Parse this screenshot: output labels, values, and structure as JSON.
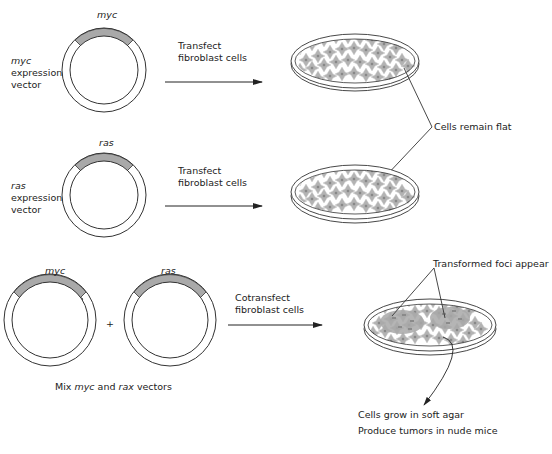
{
  "colors": {
    "insert_gray": "#a9a9a9",
    "cell_gray": "#b0b0b0",
    "cell_center": "#8a8a8a",
    "line": "#333333"
  },
  "row1": {
    "plasmid_label": "myc",
    "vector_label_gene": "myc",
    "vector_label_l2": "expression",
    "vector_label_l3": "vector",
    "arrow_l1": "Transfect",
    "arrow_l2": "fibroblast cells"
  },
  "row2": {
    "plasmid_label": "ras",
    "vector_label_gene": "ras",
    "vector_label_l2": "expression",
    "vector_label_l3": "vector",
    "arrow_l1": "Transfect",
    "arrow_l2": "fibroblast cells"
  },
  "callout_flat": "Cells remain flat",
  "row3": {
    "plasmid1_label": "myc",
    "plasmid2_label": "ras",
    "plus": "+",
    "arrow_l1": "Cotransfect",
    "arrow_l2": "fibroblast cells",
    "mix_prefix": "Mix ",
    "mix_gene1": "myc",
    "mix_mid": " and ",
    "mix_gene2": "rax",
    "mix_suffix": " vectors",
    "foci_label": "Transformed foci appear",
    "outcome_l1": "Cells grow in soft agar",
    "outcome_l2": "Produce tumors in nude mice"
  }
}
